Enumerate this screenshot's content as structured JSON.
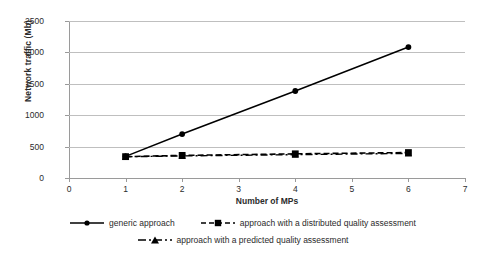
{
  "chart_data": {
    "type": "line",
    "title": "",
    "xlabel": "Number of MPs",
    "ylabel": "Network traffic (Mb)",
    "xlim": [
      0,
      7
    ],
    "ylim": [
      0,
      2500
    ],
    "xticks": [
      "0",
      "1",
      "2",
      "3",
      "4",
      "5",
      "6",
      "7"
    ],
    "yticks": [
      "0",
      "500",
      "1000",
      "1500",
      "2000",
      "2500"
    ],
    "grid": true,
    "legend_position": "bottom",
    "x": [
      1,
      2,
      4,
      6
    ],
    "series": [
      {
        "name": "generic approach",
        "values": [
          345,
          700,
          1385,
          2085
        ],
        "marker": "circle",
        "line_style": "solid",
        "color": "#000000"
      },
      {
        "name": "approach with a distributed quality assessment",
        "values": [
          340,
          360,
          385,
          405
        ],
        "marker": "square",
        "line_style": "dashed",
        "color": "#000000"
      },
      {
        "name": "approach with a predicted quality assessment",
        "values": [
          338,
          352,
          372,
          392
        ],
        "marker": "triangle",
        "line_style": "dashdot",
        "color": "#000000"
      }
    ]
  },
  "axes": {
    "y_title": "Network traffic (Mb)",
    "x_title": "Number of MPs",
    "y_labels": [
      "2500",
      "2000",
      "1500",
      "1000",
      "500",
      "0"
    ],
    "x_labels": [
      "0",
      "1",
      "2",
      "3",
      "4",
      "5",
      "6",
      "7"
    ]
  },
  "legend": {
    "row1": [
      {
        "label": "generic approach",
        "marker": "circle-marker",
        "style": "solid"
      },
      {
        "label": "approach with a distributed quality assessment",
        "marker": "square-marker",
        "style": "dashed"
      }
    ],
    "row2": [
      {
        "label": "approach with a predicted quality assessment",
        "marker": "triangle-marker",
        "style": "dashdot"
      }
    ]
  },
  "colors": {
    "line": "#000000",
    "grid": "#bfbfbf",
    "axis": "#9a9a9a",
    "text": "#2b2b2b",
    "background": "#ffffff"
  }
}
